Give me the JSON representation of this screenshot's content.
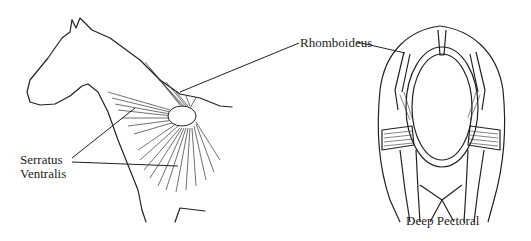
{
  "diagram": {
    "left_view": "lateral view of horse head, neck and forequarter",
    "right_view": "cranial cross-section of thorax",
    "labels": {
      "rhomboideus": "Rhomboideus",
      "serratus_line1": "Serratus",
      "serratus_line2": "Ventralis",
      "deep_pectoral": "Deep Pectoral"
    },
    "colors": {
      "ink": "#222222",
      "background": "#ffffff"
    }
  }
}
